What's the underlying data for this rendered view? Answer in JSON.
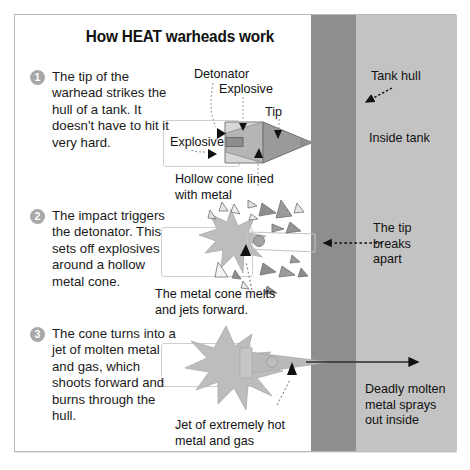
{
  "diagram": {
    "title": "How HEAT warheads work",
    "steps": [
      {
        "num": "1",
        "text": "The tip of the warhead strikes the hull of a tank. It doesn't have to hit it very hard."
      },
      {
        "num": "2",
        "text": "The impact triggers the detonator. This sets off explosives around a hollow metal cone."
      },
      {
        "num": "3",
        "text": "The cone turns into a jet of molten metal and gas, which shoots forward and burns through the hull."
      }
    ],
    "labels": {
      "detonator": "Detonator",
      "explosive_top": "Explosive",
      "explosive_left": "Explosive",
      "tip": "Tip",
      "hollow_cone": "Hollow cone lined\nwith metal",
      "cone_melts": "The metal cone melts\nand jets forward.",
      "jet": "Jet of extremely hot\nmetal and gas",
      "tank_hull": "Tank hull",
      "inside_tank": "Inside tank",
      "tip_breaks": "The tip\nbreaks\napart",
      "deadly": "Deadly molten\nmetal sprays\nout inside"
    },
    "colors": {
      "hull_dark": "#8e8e8e",
      "inside_light": "#c3c3c3",
      "warhead_light": "#d2d2d2",
      "warhead_dark": "#939393",
      "explosion": "#bcbcbc",
      "frame": "#b9b9b9",
      "step_badge": "#a8a8a8",
      "text": "#1a1a1a"
    }
  }
}
